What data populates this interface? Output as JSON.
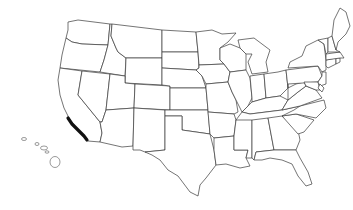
{
  "map": {
    "title": "",
    "type": "outline-map",
    "region": "United States",
    "background": "#ffffff",
    "stroke_color": "#3a3a3a",
    "highlight_color": "#111111",
    "highlight": {
      "name": "southern-california-coast",
      "path": "M68,118 L72,124 L76,128 L80,132 L84,136 L87,140"
    },
    "states": [
      {
        "id": "WA",
        "points": "68,22 78,20 110,24 108,45 82,44 72,42 66,38 68,30"
      },
      {
        "id": "OR",
        "points": "66,38 72,42 82,44 108,45 104,60 100,72 60,68 62,55"
      },
      {
        "id": "CA",
        "points": "60,68 82,71 78,95 100,122 102,133 100,142 88,141 80,132 70,120 64,108 60,95 58,80"
      },
      {
        "id": "NV",
        "points": "82,71 110,74 106,110 102,122 100,122 78,95"
      },
      {
        "id": "ID",
        "points": "110,24 112,24 111,36 116,48 118,52 126,58 125,76 100,72 104,60 108,45"
      },
      {
        "id": "MT",
        "points": "112,24 162,30 162,58 126,58 118,52 116,48 111,36"
      },
      {
        "id": "WY",
        "points": "126,58 162,58 162,85 125,83"
      },
      {
        "id": "UT",
        "points": "110,74 125,76 125,83 135,84 134,108 106,110"
      },
      {
        "id": "AZ",
        "points": "106,110 134,108 133,146 122,147 100,142 102,133 100,122 102,122"
      },
      {
        "id": "CO",
        "points": "135,84 170,86 170,110 134,108"
      },
      {
        "id": "NM",
        "points": "134,108 165,110 165,150 145,152 140,150 133,150 133,146"
      },
      {
        "id": "ND",
        "points": "162,30 196,32 198,52 162,52"
      },
      {
        "id": "SD",
        "points": "162,52 198,52 199,68 196,70 162,68"
      },
      {
        "id": "NE",
        "points": "162,68 196,70 202,76 206,88 170,88 170,86 162,85"
      },
      {
        "id": "KS",
        "points": "170,88 206,88 208,110 170,110"
      },
      {
        "id": "OK",
        "points": "165,110 208,110 210,134 196,132 182,130 182,116 165,116"
      },
      {
        "id": "TX",
        "points": "165,116 182,116 182,130 196,132 210,134 214,150 216,165 206,178 200,185 198,196 190,192 178,176 168,170 160,160 152,155 145,152 165,150"
      },
      {
        "id": "MN",
        "points": "196,32 212,30 222,34 236,33 228,42 220,48 220,60 224,64 199,65 198,52"
      },
      {
        "id": "IA",
        "points": "199,65 224,64 230,72 228,82 206,84 202,76 196,70 199,68"
      },
      {
        "id": "MO",
        "points": "206,84 228,82 232,92 236,100 238,112 234,114 208,112 208,110 206,88"
      },
      {
        "id": "AR",
        "points": "208,112 234,114 236,120 234,136 214,138 210,134"
      },
      {
        "id": "LA",
        "points": "214,138 234,136 234,150 248,150 246,158 250,166 240,168 226,164 216,165 214,150"
      },
      {
        "id": "WI",
        "points": "220,48 230,44 240,48 246,54 246,70 230,72 224,64 220,60"
      },
      {
        "id": "IL",
        "points": "230,72 246,70 250,78 252,98 248,106 242,112 236,100 232,92 228,82"
      },
      {
        "id": "MI",
        "points": "238,40 254,38 262,44 270,50 266,62 268,72 252,74 248,62 252,54 246,54 240,48"
      },
      {
        "id": "IN",
        "points": "250,76 264,74 266,98 252,102 252,98"
      },
      {
        "id": "OH",
        "points": "264,74 278,72 286,70 288,88 280,96 266,98"
      },
      {
        "id": "KY",
        "points": "248,106 252,102 266,98 280,96 288,100 282,110 250,114 242,112"
      },
      {
        "id": "TN",
        "points": "242,112 250,114 282,110 300,106 294,116 238,124 236,120"
      },
      {
        "id": "MS",
        "points": "236,120 252,120 252,158 246,158 248,150 234,150 234,136"
      },
      {
        "id": "AL",
        "points": "252,120 268,118 274,150 256,152 254,160 252,158"
      },
      {
        "id": "GA",
        "points": "268,118 282,116 298,130 300,140 296,150 274,150"
      },
      {
        "id": "FL",
        "points": "256,152 274,150 296,150 300,158 308,172 312,184 306,186 298,176 292,164 282,160 270,158 262,160 254,160"
      },
      {
        "id": "SC",
        "points": "282,116 296,114 314,120 304,132 298,134"
      },
      {
        "id": "NC",
        "points": "300,106 324,100 326,108 316,118 296,114 282,116 294,110"
      },
      {
        "id": "VA",
        "points": "282,110 288,100 298,92 306,86 316,90 322,98 300,106"
      },
      {
        "id": "WV",
        "points": "288,88 296,84 304,82 306,86 298,92 288,100"
      },
      {
        "id": "PA",
        "points": "286,70 318,66 322,76 318,82 288,84 288,88"
      },
      {
        "id": "NY",
        "points": "290,62 302,56 306,46 318,40 324,44 326,60 326,70 322,72 318,66 288,68"
      },
      {
        "id": "MD",
        "points": "304,82 318,82 320,90 316,90 306,86"
      },
      {
        "id": "NJ",
        "points": "322,72 326,72 326,84 320,86 318,82 322,76"
      },
      {
        "id": "DE",
        "points": "320,84 324,88 322,92 318,88"
      },
      {
        "id": "CT",
        "points": "326,60 336,58 336,64 328,68 326,66"
      },
      {
        "id": "RI",
        "points": "336,58 340,58 340,62 336,64"
      },
      {
        "id": "MA",
        "points": "326,54 340,52 344,58 340,58 326,60"
      },
      {
        "id": "VT",
        "points": "318,40 328,38 328,52 326,54 324,44"
      },
      {
        "id": "NH",
        "points": "328,38 332,36 336,50 340,52 328,52"
      },
      {
        "id": "ME",
        "points": "332,36 334,20 340,8 346,12 350,26 346,34 338,42 336,50"
      }
    ],
    "islands": [
      {
        "id": "HI-1",
        "cx": 24,
        "cy": 139,
        "rx": 2.5,
        "ry": 1.5
      },
      {
        "id": "HI-2",
        "cx": 37,
        "cy": 144,
        "rx": 2.0,
        "ry": 1.5
      },
      {
        "id": "HI-3",
        "cx": 44,
        "cy": 148,
        "rx": 3.5,
        "ry": 2.0
      },
      {
        "id": "HI-4",
        "cx": 47,
        "cy": 152,
        "rx": 2.0,
        "ry": 1.2
      },
      {
        "id": "HI-5",
        "cx": 55,
        "cy": 162,
        "rx": 5.0,
        "ry": 5.5
      }
    ]
  }
}
